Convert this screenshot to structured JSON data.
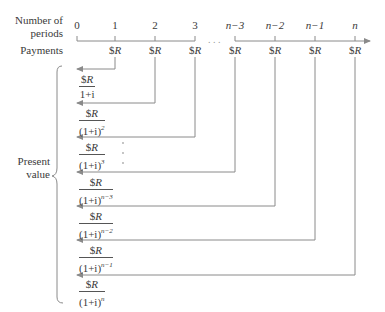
{
  "labels": {
    "periods_line1": "Number of",
    "periods_line2": "periods",
    "payments": "Payments",
    "present_line1": "Present",
    "present_line2": "value"
  },
  "ticks": [
    {
      "label": "0",
      "x": 77
    },
    {
      "label": "1",
      "x": 115
    },
    {
      "label": "2",
      "x": 155
    },
    {
      "label": "3",
      "x": 195
    },
    {
      "label": "n−3",
      "x": 235
    },
    {
      "label": "n−2",
      "x": 275
    },
    {
      "label": "n−1",
      "x": 315
    },
    {
      "label": "n",
      "x": 355
    }
  ],
  "payment_symbol": "$",
  "payment_var": "R",
  "ellipsis": ". . .",
  "present_values": [
    {
      "numerator": "$R",
      "denominator": "1+i",
      "exponent": ""
    },
    {
      "numerator": "$R",
      "denominator": "(1+i)",
      "exponent": "2"
    },
    {
      "numerator": "$R",
      "denominator": "(1+i)",
      "exponent": "3"
    },
    {
      "numerator": "$R",
      "denominator": "(1+i)",
      "exponent": "n−3"
    },
    {
      "numerator": "$R",
      "denominator": "(1+i)",
      "exponent": "n−2"
    },
    {
      "numerator": "$R",
      "denominator": "(1+i)",
      "exponent": "n−1"
    },
    {
      "numerator": "$R",
      "denominator": "(1+i)",
      "exponent": "n"
    }
  ],
  "colors": {
    "line": "#8a8a8a",
    "text": "#3a3a3a"
  }
}
